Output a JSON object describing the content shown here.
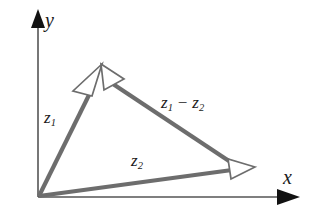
{
  "figure": {
    "name": "complex-vector-subtraction-diagram",
    "background_color": "#ffffff",
    "width": 318,
    "height": 220
  },
  "axes": {
    "color": "#4a4a4a",
    "arrow_color": "#111111",
    "origin": {
      "x": 38,
      "y": 197
    },
    "x_axis": {
      "label": "x",
      "from": {
        "x": 38,
        "y": 197
      },
      "to": {
        "x": 298,
        "y": 197
      }
    },
    "y_axis": {
      "label": "y",
      "from": {
        "x": 38,
        "y": 197
      },
      "to": {
        "x": 38,
        "y": 14
      }
    }
  },
  "vectors": {
    "color": "#6d6d6d",
    "arrowhead_fill": "#ffffff",
    "arrowhead_stroke": "#6d6d6d",
    "items": [
      {
        "name": "z1",
        "label": "z",
        "subscript": "1",
        "from": {
          "x": 38,
          "y": 197
        },
        "to": {
          "x": 102,
          "y": 69
        }
      },
      {
        "name": "z2",
        "label": "z",
        "subscript": "2",
        "from": {
          "x": 38,
          "y": 197
        },
        "to": {
          "x": 252,
          "y": 169
        }
      },
      {
        "name": "z1-minus-z2",
        "label": "z",
        "subscript": "1",
        "operator": "−",
        "label2": "z",
        "subscript2": "2",
        "from": {
          "x": 252,
          "y": 169
        },
        "to": {
          "x": 102,
          "y": 69
        }
      }
    ]
  },
  "labels": {
    "y_axis": "y",
    "x_axis": "x",
    "z1": {
      "base": "z",
      "sub": "1"
    },
    "z2": {
      "base": "z",
      "sub": "2"
    },
    "z1_minus_z2": {
      "base1": "z",
      "sub1": "1",
      "operator": "−",
      "base2": "z",
      "sub2": "2"
    }
  }
}
